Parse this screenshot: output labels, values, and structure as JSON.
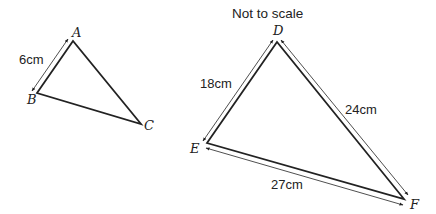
{
  "note": "Not to scale",
  "triangle_small": {
    "vertices": {
      "A": "A",
      "B": "B",
      "C": "C"
    },
    "measurements": {
      "AB": "6cm"
    }
  },
  "triangle_large": {
    "vertices": {
      "D": "D",
      "E": "E",
      "F": "F"
    },
    "measurements": {
      "DE": "18cm",
      "DF": "24cm",
      "EF": "27cm"
    }
  },
  "colors": {
    "line": "#222222",
    "background": "#ffffff"
  }
}
